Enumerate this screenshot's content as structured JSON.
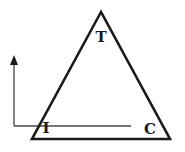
{
  "diagram": {
    "type": "triangle-with-axis",
    "vertices": {
      "top": {
        "label": "T"
      },
      "bottom_left": {
        "label": "I"
      },
      "bottom_right": {
        "label": "C"
      }
    },
    "colors": {
      "stroke": "#1a1a1a",
      "axis": "#444444",
      "background": "#ffffff"
    }
  }
}
